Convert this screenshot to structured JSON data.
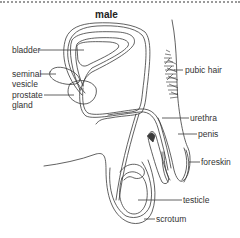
{
  "diagram": {
    "title": "male",
    "labels": {
      "bladder": "bladder",
      "seminal_vesicle_1": "seminal",
      "seminal_vesicle_2": "vesicle",
      "prostate_gland_1": "prostate",
      "prostate_gland_2": "gland",
      "pubic_hair": "pubic hair",
      "urethra": "urethra",
      "penis": "penis",
      "foreskin": "foreskin",
      "testicle": "testicle",
      "scrotum": "scrotum"
    },
    "colors": {
      "line": "#3a3a3a",
      "text": "#333333",
      "background": "#ffffff",
      "border": "#9a9a9a"
    }
  }
}
